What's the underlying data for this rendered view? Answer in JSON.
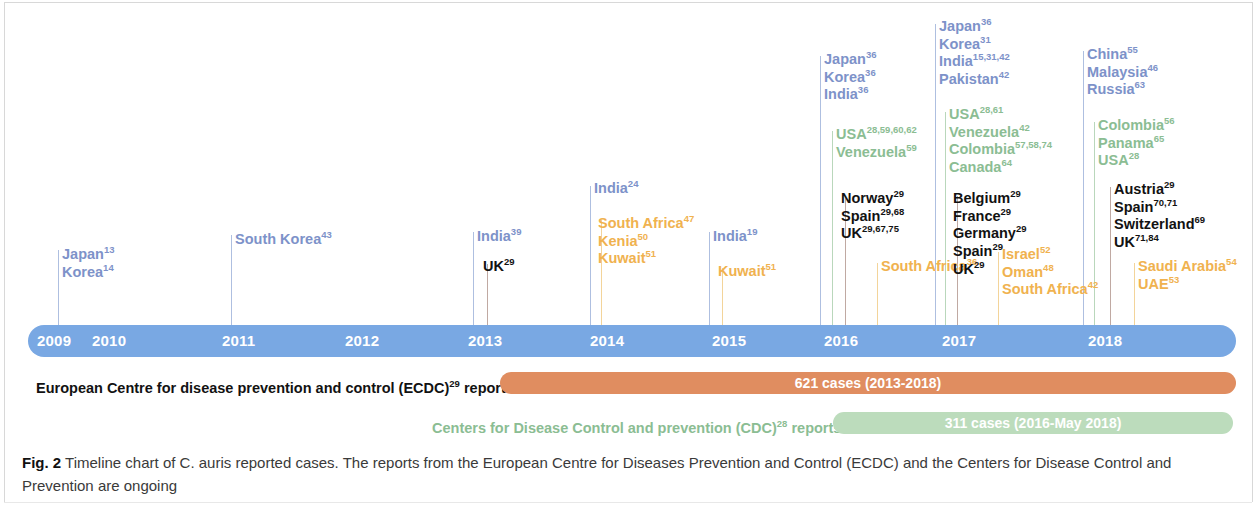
{
  "figure": {
    "caption_tag": "Fig. 2",
    "caption_text": " Timeline chart of C. auris reported cases. The reports from the European Centre for Diseases Prevention and Control (ECDC) and the Centers for Disease Control and Prevention are ongoing"
  },
  "colors": {
    "timeline_bar": "#79a8e3",
    "asia_blue": "#7d92c9",
    "americas_green": "#8bbd93",
    "europe_black": "#121212",
    "africa_middle_east_orange": "#f0b24f",
    "ecdc_bar": "#e08d60",
    "cdc_bar": "#bcdcbc"
  },
  "timeline": {
    "years": [
      "2009",
      "2010",
      "2011",
      "2012",
      "2013",
      "2014",
      "2015",
      "2016",
      "2017",
      "2018"
    ]
  },
  "reports": {
    "ecdc": {
      "label": "European Centre for disease prevention and control (ECDC)29 reports",
      "label_html": "European Centre for disease prevention and control (ECDC)<sup>29</sup> reports",
      "bar_text": "621 cases (2013-2018)"
    },
    "cdc": {
      "label": "Centers for Disease Control and prevention (CDC)28 reports",
      "label_html": "Centers for Disease Control and prevention (CDC)<sup>28</sup> reports",
      "bar_text": "311 cases (2016-May 2018)"
    }
  },
  "chart_data": {
    "type": "timeline",
    "title": "Timeline chart of C. auris reported cases",
    "x": [
      "2009",
      "2010",
      "2011",
      "2012",
      "2013",
      "2014",
      "2015",
      "2016",
      "2017",
      "2018"
    ],
    "xlabel": "Year",
    "axis_range": [
      2009,
      2018
    ],
    "legend": [
      {
        "name": "Asia / blue group",
        "color": "#7d92c9"
      },
      {
        "name": "Americas / green group",
        "color": "#8bbd93"
      },
      {
        "name": "Europe / black group",
        "color": "#121212"
      },
      {
        "name": "Africa & Middle East / orange group",
        "color": "#f0b24f"
      }
    ],
    "events": [
      {
        "year": "2009",
        "color_group": "blue",
        "entries": [
          {
            "country": "Japan",
            "refs": "13"
          },
          {
            "country": "Korea",
            "refs": "14"
          }
        ]
      },
      {
        "year": "2011",
        "color_group": "blue",
        "entries": [
          {
            "country": "South Korea",
            "refs": "43"
          }
        ]
      },
      {
        "year": "2013",
        "color_group": "blue",
        "entries": [
          {
            "country": "India",
            "refs": "39"
          }
        ]
      },
      {
        "year": "2013",
        "color_group": "black",
        "entries": [
          {
            "country": "UK",
            "refs": "29"
          }
        ]
      },
      {
        "year": "2014",
        "color_group": "blue",
        "entries": [
          {
            "country": "India",
            "refs": "24"
          }
        ]
      },
      {
        "year": "2014",
        "color_group": "orange",
        "entries": [
          {
            "country": "South Africa",
            "refs": "47"
          },
          {
            "country": "Kenia",
            "refs": "50"
          },
          {
            "country": "Kuwait",
            "refs": "51"
          }
        ]
      },
      {
        "year": "2015",
        "color_group": "blue",
        "entries": [
          {
            "country": "India",
            "refs": "19"
          }
        ]
      },
      {
        "year": "2015",
        "color_group": "orange",
        "entries": [
          {
            "country": "Kuwait",
            "refs": "51"
          }
        ]
      },
      {
        "year": "2016",
        "color_group": "blue",
        "entries": [
          {
            "country": "Japan",
            "refs": "36"
          },
          {
            "country": "Korea",
            "refs": "36"
          },
          {
            "country": "India",
            "refs": "36"
          }
        ]
      },
      {
        "year": "2016",
        "color_group": "green",
        "entries": [
          {
            "country": "USA",
            "refs": "28,59,60,62"
          },
          {
            "country": "Venezuela",
            "refs": "59"
          }
        ]
      },
      {
        "year": "2016",
        "color_group": "black",
        "entries": [
          {
            "country": "Norway",
            "refs": "29"
          },
          {
            "country": "Spain",
            "refs": "29,68"
          },
          {
            "country": "UK",
            "refs": "29,67,75"
          }
        ]
      },
      {
        "year": "2016",
        "color_group": "orange",
        "entries": [
          {
            "country": "South Africa",
            "refs": "36"
          }
        ]
      },
      {
        "year": "2017",
        "color_group": "blue",
        "entries": [
          {
            "country": "Japan",
            "refs": "36"
          },
          {
            "country": "Korea",
            "refs": "31"
          },
          {
            "country": "India",
            "refs": "15,31,42"
          },
          {
            "country": "Pakistan",
            "refs": "42"
          }
        ]
      },
      {
        "year": "2017",
        "color_group": "green",
        "entries": [
          {
            "country": "USA",
            "refs": "28,61"
          },
          {
            "country": "Venezuela",
            "refs": "42"
          },
          {
            "country": "Colombia",
            "refs": "57,58,74"
          },
          {
            "country": "Canada",
            "refs": "64"
          }
        ]
      },
      {
        "year": "2017",
        "color_group": "black",
        "entries": [
          {
            "country": "Belgium",
            "refs": "29"
          },
          {
            "country": "France",
            "refs": "29"
          },
          {
            "country": "Germany",
            "refs": "29"
          },
          {
            "country": "Spain",
            "refs": "29"
          },
          {
            "country": "UK",
            "refs": "29"
          }
        ]
      },
      {
        "year": "2017",
        "color_group": "orange",
        "entries": [
          {
            "country": "Israel",
            "refs": "52"
          },
          {
            "country": "Oman",
            "refs": "48"
          },
          {
            "country": "South Africa",
            "refs": "42"
          }
        ]
      },
      {
        "year": "2018",
        "color_group": "blue",
        "entries": [
          {
            "country": "China",
            "refs": "55"
          },
          {
            "country": "Malaysia",
            "refs": "46"
          },
          {
            "country": "Russia",
            "refs": "63"
          }
        ]
      },
      {
        "year": "2018",
        "color_group": "green",
        "entries": [
          {
            "country": "Colombia",
            "refs": "56"
          },
          {
            "country": "Panama",
            "refs": "65"
          },
          {
            "country": "USA",
            "refs": "28"
          }
        ]
      },
      {
        "year": "2018",
        "color_group": "black",
        "entries": [
          {
            "country": "Austria",
            "refs": "29"
          },
          {
            "country": "Spain",
            "refs": "70,71"
          },
          {
            "country": "Switzerland",
            "refs": "69"
          },
          {
            "country": "UK",
            "refs": "71,84"
          }
        ]
      },
      {
        "year": "2018",
        "color_group": "orange",
        "entries": [
          {
            "country": "Saudi Arabia",
            "refs": "54"
          },
          {
            "country": "UAE",
            "refs": "53"
          }
        ]
      }
    ],
    "report_bars": [
      {
        "source": "ECDC",
        "text": "621 cases (2013-2018)",
        "color": "#e08d60"
      },
      {
        "source": "CDC",
        "text": "311 cases (2016-May 2018)",
        "color": "#bcdcbc"
      }
    ]
  },
  "layout": {
    "groups": [
      {
        "id": "g2009-blue",
        "x": 62,
        "y": 246,
        "line_x": 58,
        "line_top": 250,
        "color": "blue"
      },
      {
        "id": "g2011-blue",
        "x": 235,
        "y": 231,
        "line_x": 231,
        "line_top": 235,
        "color": "blue"
      },
      {
        "id": "g2013-blue",
        "x": 477,
        "y": 228,
        "line_x": 473,
        "line_top": 232,
        "color": "blue"
      },
      {
        "id": "g2013-black",
        "x": 483,
        "y": 258,
        "line_x": 487,
        "line_top": 264,
        "color": "black"
      },
      {
        "id": "g2014-blue",
        "x": 594,
        "y": 180,
        "line_x": 590,
        "line_top": 186,
        "color": "blue"
      },
      {
        "id": "g2014-orange",
        "x": 598,
        "y": 215,
        "line_x": 601,
        "line_top": 220,
        "color": "orange"
      },
      {
        "id": "g2015-blue",
        "x": 713,
        "y": 228,
        "line_x": 709,
        "line_top": 232,
        "color": "blue"
      },
      {
        "id": "g2015-orange",
        "x": 718,
        "y": 263,
        "line_x": 722,
        "line_top": 268,
        "color": "orange"
      },
      {
        "id": "g2016-blue",
        "x": 824,
        "y": 51,
        "line_x": 820,
        "line_top": 56,
        "color": "blue"
      },
      {
        "id": "g2016-green",
        "x": 836,
        "y": 126,
        "line_x": 832,
        "line_top": 131,
        "color": "green"
      },
      {
        "id": "g2016-black",
        "x": 841,
        "y": 190,
        "line_x": 845,
        "line_top": 196,
        "color": "black"
      },
      {
        "id": "g2016-orange",
        "x": 881,
        "y": 258,
        "line_x": 877,
        "line_top": 263,
        "color": "orange"
      },
      {
        "id": "g2017-blue",
        "x": 939,
        "y": 18,
        "line_x": 935,
        "line_top": 24,
        "color": "blue"
      },
      {
        "id": "g2017-green",
        "x": 949,
        "y": 106,
        "line_x": 945,
        "line_top": 112,
        "color": "green"
      },
      {
        "id": "g2017-black",
        "x": 953,
        "y": 190,
        "line_x": 957,
        "line_top": 196,
        "color": "black"
      },
      {
        "id": "g2017-orange",
        "x": 1002,
        "y": 246,
        "line_x": 998,
        "line_top": 252,
        "color": "orange"
      },
      {
        "id": "g2018-blue",
        "x": 1087,
        "y": 46,
        "line_x": 1083,
        "line_top": 51,
        "color": "blue"
      },
      {
        "id": "g2018-green",
        "x": 1098,
        "y": 117,
        "line_x": 1094,
        "line_top": 122,
        "color": "green"
      },
      {
        "id": "g2018-black",
        "x": 1114,
        "y": 181,
        "line_x": 1110,
        "line_top": 187,
        "color": "black"
      },
      {
        "id": "g2018-orange",
        "x": 1138,
        "y": 258,
        "line_x": 1134,
        "line_top": 263,
        "color": "orange"
      }
    ],
    "year_label_x": [
      37,
      92,
      222,
      345,
      468,
      590,
      712,
      824,
      942,
      1088
    ]
  }
}
